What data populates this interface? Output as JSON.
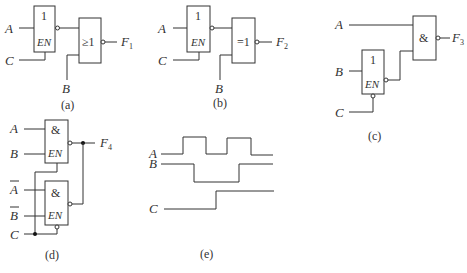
{
  "circuits": {
    "a": {
      "caption": "(a)",
      "inputs": {
        "A": "A",
        "C": "C",
        "B": "B"
      },
      "buffer_symbol": "1",
      "enable_label": "EN",
      "gate_symbol": "≥1",
      "output": "F",
      "output_sub": "1"
    },
    "b": {
      "caption": "(b)",
      "inputs": {
        "A": "A",
        "C": "C",
        "B": "B"
      },
      "buffer_symbol": "1",
      "enable_label": "EN",
      "gate_symbol": "=1",
      "output": "F",
      "output_sub": "2"
    },
    "c": {
      "caption": "(c)",
      "inputs": {
        "A": "A",
        "B": "B",
        "C": "C"
      },
      "buffer_symbol": "1",
      "enable_label": "EN",
      "gate_symbol": "&",
      "output": "F",
      "output_sub": "3"
    },
    "d": {
      "caption": "(d)",
      "inputs": {
        "A": "A",
        "B": "B",
        "A_bar": "A",
        "B_bar": "B",
        "C": "C"
      },
      "gate1_symbol": "&",
      "gate1_enable": "EN",
      "gate2_symbol": "&",
      "gate2_enable": "EN",
      "output": "F",
      "output_sub": "4"
    },
    "e": {
      "caption": "(e)",
      "signals": [
        {
          "name": "A",
          "levels": [
            0,
            1,
            0,
            1,
            0
          ]
        },
        {
          "name": "B",
          "levels": [
            1,
            0,
            1
          ]
        },
        {
          "name": "C",
          "levels": [
            0,
            1
          ]
        }
      ]
    }
  }
}
